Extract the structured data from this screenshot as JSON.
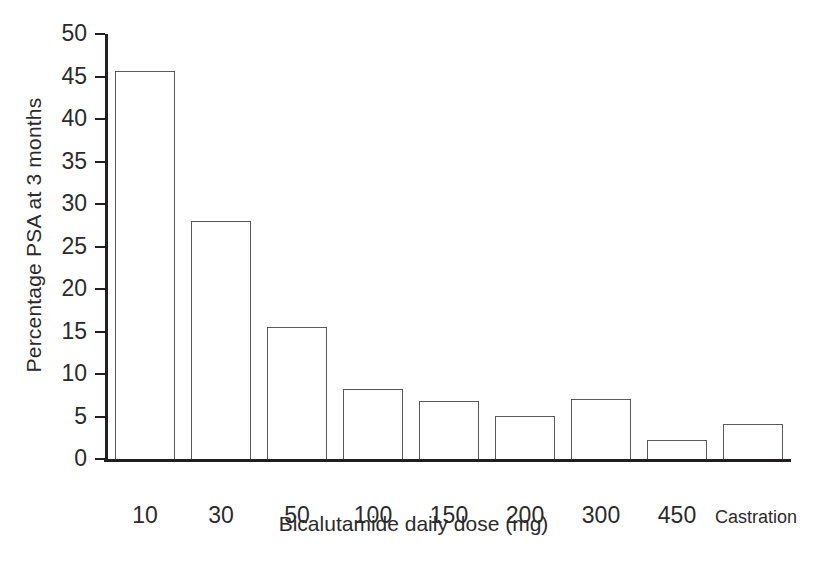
{
  "chart_data": {
    "type": "bar",
    "title": "",
    "xlabel": "Bicalutamide daily dose (mg)",
    "ylabel": "Percentage PSA at 3 months",
    "categories": [
      "10",
      "30",
      "50",
      "100",
      "150",
      "200",
      "300",
      "450",
      "Castration"
    ],
    "values": [
      45.7,
      28.0,
      15.5,
      8.2,
      6.8,
      5.1,
      7.1,
      2.2,
      4.1
    ],
    "ylim": [
      0,
      50
    ],
    "yticks": [
      0,
      5,
      10,
      15,
      20,
      25,
      30,
      35,
      40,
      45,
      50
    ],
    "ytick_labels": [
      "0",
      "5",
      "10",
      "15",
      "20",
      "25",
      "30",
      "35",
      "40",
      "45",
      "50"
    ],
    "grid": false,
    "legend": null,
    "bar_facecolor": "#ffffff",
    "bar_edgecolor": "#58595b",
    "axis_color": "#231f20",
    "background": "#ffffff",
    "small_label_categories": [
      "Castration"
    ]
  }
}
